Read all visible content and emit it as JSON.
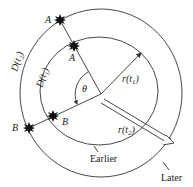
{
  "figure": {
    "type": "expanding-universe-diagram",
    "circles": [
      {
        "id": "earlier",
        "label": "Earlier",
        "radius_label": "r(t₁)",
        "distance_label": "D(t₁)"
      },
      {
        "id": "later",
        "label": "Later",
        "radius_label": "r(t₂)",
        "distance_label": "D(t₂)"
      }
    ],
    "points": {
      "a_outer": "A",
      "a_inner": "A",
      "b_outer": "B",
      "b_inner": "B"
    },
    "angle_label": "θ",
    "labels": {
      "earlier": "Earlier",
      "later": "Later",
      "r_t1_main": "r",
      "r_t1_sub": "(t",
      "r_t1_idx": "1",
      "r_t1_close": ")",
      "r_t2_main": "r",
      "r_t2_sub": "(t",
      "r_t2_idx": "2",
      "r_t2_close": ")",
      "d_t1": "D(t₁)",
      "d_t2": "D(t₂)"
    },
    "colors": {
      "stroke": "#333333",
      "star": "#111111",
      "text": "#222222",
      "background": "#ffffff"
    }
  }
}
